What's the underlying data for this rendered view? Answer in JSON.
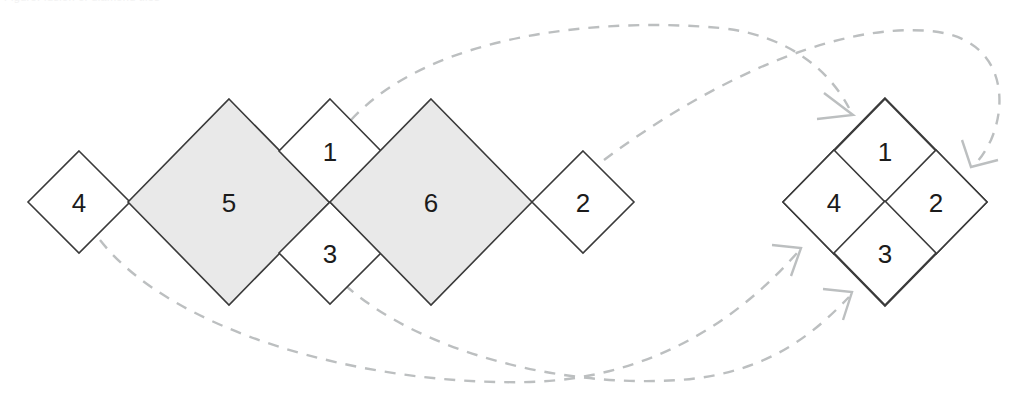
{
  "figure": {
    "title_clipped": "Figure: fusion of diamond tiles",
    "background_color": "#ffffff",
    "width": 1022,
    "height": 409
  },
  "style": {
    "tile_stroke": "#3a3a3a",
    "tile_stroke_width": 1.6,
    "tile_fill_plain": "#ffffff",
    "tile_fill_shaded": "#e9e9e9",
    "arrow_color": "#bcbfc0",
    "arrow_width": 2.4,
    "arrow_dash": "11 9",
    "label_color": "#1b1b1b",
    "label_size": 26
  },
  "left_group": {
    "name": "source-tiling",
    "tiles": [
      {
        "id": "tile-4",
        "label": "4",
        "cx": 79,
        "cy": 202,
        "rx": 51,
        "ry": 51,
        "shaded": false
      },
      {
        "id": "tile-5",
        "label": "5",
        "cx": 229,
        "cy": 202,
        "rx": 101,
        "ry": 103,
        "shaded": true
      },
      {
        "id": "tile-1",
        "label": "1",
        "cx": 330,
        "cy": 151,
        "rx": 51,
        "ry": 52,
        "shaded": false
      },
      {
        "id": "tile-3",
        "label": "3",
        "cx": 330,
        "cy": 253,
        "rx": 51,
        "ry": 51,
        "shaded": false
      },
      {
        "id": "tile-6",
        "label": "6",
        "cx": 431,
        "cy": 202,
        "rx": 101,
        "ry": 103,
        "shaded": true
      },
      {
        "id": "tile-2",
        "label": "2",
        "cx": 583,
        "cy": 202,
        "rx": 51,
        "ry": 51,
        "shaded": false
      }
    ]
  },
  "right_group": {
    "name": "target-tiling",
    "outline": {
      "cx": 885,
      "cy": 202,
      "rx": 102,
      "ry": 104
    },
    "tiles": [
      {
        "id": "result-tile-1",
        "label": "1",
        "cx": 885,
        "cy": 151,
        "rx": 51,
        "ry": 52,
        "shaded": false
      },
      {
        "id": "result-tile-4",
        "label": "4",
        "cx": 834,
        "cy": 202,
        "rx": 51,
        "ry": 52,
        "shaded": false
      },
      {
        "id": "result-tile-2",
        "label": "2",
        "cx": 936,
        "cy": 202,
        "rx": 51,
        "ry": 52,
        "shaded": false
      },
      {
        "id": "result-tile-3",
        "label": "3",
        "cx": 885,
        "cy": 253,
        "rx": 51,
        "ry": 52,
        "shaded": false
      }
    ]
  },
  "arrows": [
    {
      "id": "arrow-1-to-1",
      "from_tile": "1",
      "to_tile": "1",
      "path": "M 351 120 C 430 34 600 17 720 28 C 790 35 830 72 849 108",
      "head": "M 824 93 L 853 115 L 817 119"
    },
    {
      "id": "arrow-2-to-2",
      "from_tile": "2",
      "to_tile": "2",
      "path": "M 604 160 C 700 88 830 22 930 31 C 1000 37 1010 96 991 140 C 983 156 979 160 974 165",
      "head": "M 962 140 L 971 167 L 998 160"
    },
    {
      "id": "arrow-4-to-4",
      "from_tile": "4",
      "to_tile": "4",
      "path": "M 100 240 C 170 330 360 386 530 382 C 660 378 745 312 797 253",
      "head": "M 772 245 L 801 248 L 791 276"
    },
    {
      "id": "arrow-3-to-3",
      "from_tile": "3",
      "to_tile": "3",
      "path": "M 345 285 C 420 352 560 388 680 380 C 770 373 815 332 849 297",
      "head": "M 823 289 L 852 292 L 843 320"
    }
  ]
}
